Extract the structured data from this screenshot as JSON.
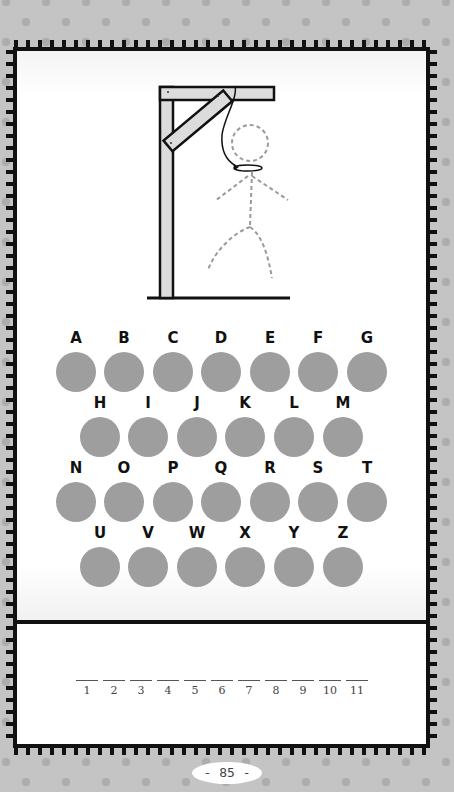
{
  "puzzle": {
    "type": "hangman",
    "letters_row1": [
      "A",
      "B",
      "C",
      "D",
      "E",
      "F",
      "G"
    ],
    "letters_row2": [
      "H",
      "I",
      "J",
      "K",
      "L",
      "M"
    ],
    "letters_row3": [
      "N",
      "O",
      "P",
      "Q",
      "R",
      "S",
      "T"
    ],
    "letters_row4": [
      "U",
      "V",
      "W",
      "X",
      "Y",
      "Z"
    ],
    "answer_slots": [
      "1",
      "2",
      "3",
      "4",
      "5",
      "6",
      "7",
      "8",
      "9",
      "10",
      "11"
    ]
  },
  "colors": {
    "background": "#c4c4c4",
    "background_dots": "#adadad",
    "card": "#ffffff",
    "border": "#111111",
    "letter_bubble": "#9e9e9e",
    "gallows_wood": "#dcdcdc",
    "figure_dashes": "#9a9a9a"
  },
  "icons": {
    "gallows": "gallows-icon",
    "stick_figure": "stick-figure-icon",
    "noose": "noose-icon"
  },
  "footer": {
    "page_number": "- 85 -"
  }
}
